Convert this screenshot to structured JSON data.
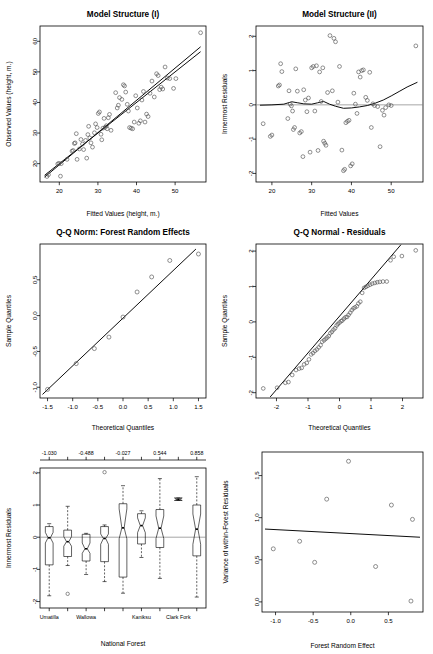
{
  "figure": {
    "kind": "model-diagnostics-panel",
    "rows": 3,
    "cols": 2,
    "point_color": "#4d4d4d",
    "line_color": "#000000",
    "ref_color": "#808080"
  },
  "chart_data": [
    {
      "id": "model-structure-1",
      "type": "scatter",
      "title": "Model Structure (I)",
      "xlabel": "Fitted Values (height, m.)",
      "ylabel": "Observed Values (height, m.)",
      "xlim": [
        15,
        58
      ],
      "ylim": [
        14,
        65
      ],
      "xticks": [
        20,
        30,
        40,
        50
      ],
      "yticks": [
        20,
        30,
        40,
        50,
        60
      ],
      "grid": false,
      "legend": null,
      "annotations": [
        "1:1 reference line",
        "least-squares fit line"
      ],
      "lines": [
        {
          "name": "y = x",
          "x": [
            16.2,
            56.6
          ],
          "y": [
            16.2,
            56.6
          ]
        },
        {
          "name": "fit",
          "x": [
            16.2,
            56.6
          ],
          "y": [
            15.6,
            58.2
          ]
        }
      ],
      "x": [
        16.8,
        17.2,
        19.6,
        19.9,
        20.3,
        20.5,
        22.0,
        23.3,
        23.6,
        23.9,
        24.1,
        24.4,
        24.6,
        25.2,
        25.6,
        26.0,
        26.3,
        26.8,
        27.1,
        27.4,
        27.6,
        27.9,
        28.2,
        28.6,
        29.1,
        29.4,
        29.8,
        30.1,
        30.4,
        30.8,
        31.0,
        31.3,
        31.6,
        31.9,
        32.2,
        32.4,
        32.7,
        33.0,
        33.4,
        34.6,
        35.0,
        35.3,
        35.6,
        36.2,
        36.6,
        36.9,
        37.2,
        37.6,
        37.9,
        38.2,
        38.6,
        39.0,
        39.4,
        39.8,
        40.2,
        40.6,
        41.0,
        41.4,
        41.8,
        42.2,
        42.6,
        43.0,
        43.5,
        44.0,
        44.6,
        45.2,
        45.6,
        46.0,
        46.4,
        46.8,
        47.4,
        48.0,
        48.6,
        49.6,
        50.2,
        56.6
      ],
      "y": [
        15.8,
        16.4,
        19.9,
        20.1,
        15.9,
        20.0,
        21.4,
        24.1,
        24.3,
        26.6,
        26.8,
        29.8,
        21.4,
        24.8,
        27.9,
        26.4,
        24.6,
        27.6,
        21.8,
        29.5,
        32.2,
        28.4,
        26.8,
        25.4,
        30.1,
        33.0,
        31.8,
        36.4,
        36.9,
        29.6,
        27.8,
        31.6,
        34.8,
        31.9,
        32.4,
        31.4,
        35.0,
        36.1,
        30.9,
        43.2,
        38.2,
        39.1,
        41.6,
        41.0,
        45.8,
        45.4,
        43.4,
        39.4,
        37.2,
        31.8,
        31.6,
        31.4,
        33.6,
        42.2,
        38.2,
        33.2,
        34.0,
        40.8,
        43.6,
        33.6,
        36.2,
        35.4,
        43.0,
        47.0,
        41.8,
        49.4,
        48.8,
        44.2,
        45.0,
        44.4,
        51.6,
        48.0,
        47.8,
        44.6,
        47.8,
        62.8
      ]
    },
    {
      "id": "model-structure-2",
      "type": "scatter",
      "title": "Model Structure (II)",
      "xlabel": "Fitted Values",
      "ylabel": "Innermost Residuals",
      "xlim": [
        16,
        58
      ],
      "ylim": [
        -2.25,
        2.3
      ],
      "xticks": [
        20,
        30,
        40,
        50
      ],
      "yticks": [
        -2,
        -1,
        0,
        1,
        2
      ],
      "grid": false,
      "legend": null,
      "annotations": [
        "horizontal zero reference line",
        "loess smoother"
      ],
      "lines": [
        {
          "name": "loess",
          "x": [
            17.0,
            20.0,
            23.0,
            25.0,
            26.5,
            28.0,
            30.0,
            31.5,
            33.0,
            34.5,
            36.0,
            38.0,
            40.0,
            42.0,
            44.0,
            46.0,
            48.0,
            50.0,
            52.0,
            54.0,
            56.6
          ],
          "y": [
            -0.01,
            0.0,
            0.02,
            0.09,
            0.06,
            0.03,
            0.02,
            0.06,
            0.1,
            0.02,
            -0.04,
            -0.1,
            -0.09,
            -0.06,
            -0.02,
            0.05,
            0.14,
            0.26,
            0.39,
            0.52,
            0.66
          ]
        }
      ],
      "x": [
        17.8,
        19.6,
        20.0,
        21.6,
        21.9,
        22.2,
        22.5,
        24.0,
        24.3,
        24.6,
        24.9,
        25.2,
        25.4,
        25.7,
        26.0,
        26.4,
        27.0,
        27.4,
        27.8,
        28.0,
        28.4,
        28.8,
        29.2,
        29.6,
        30.0,
        30.4,
        30.8,
        31.2,
        31.6,
        32.0,
        32.4,
        32.8,
        33.0,
        33.3,
        33.6,
        34.0,
        34.6,
        35.2,
        35.6,
        36.0,
        36.6,
        37.0,
        37.6,
        38.0,
        38.3,
        38.6,
        39.0,
        39.4,
        39.8,
        40.2,
        40.6,
        41.0,
        41.4,
        41.8,
        42.2,
        42.6,
        43.0,
        43.6,
        44.0,
        44.6,
        45.0,
        45.4,
        45.8,
        46.6,
        47.2,
        47.8,
        48.2,
        48.6,
        49.4,
        50.0,
        56.2
      ],
      "y": [
        -0.55,
        -0.92,
        -0.88,
        0.55,
        0.58,
        1.2,
        0.97,
        -0.4,
        0.41,
        0.02,
        -0.03,
        -0.18,
        -0.72,
        -0.66,
        1.05,
        0.4,
        -0.82,
        -0.78,
        -1.51,
        0.44,
        0.14,
        -0.2,
        0.2,
        -1.38,
        1.08,
        1.12,
        -0.18,
        1.14,
        -1.33,
        0.96,
        0.1,
        1.08,
        -1.06,
        -1.12,
        -1.18,
        0.36,
        2.02,
        0.41,
        1.94,
        1.84,
        0.08,
        1.12,
        -1.32,
        -1.92,
        -1.88,
        -0.52,
        -0.48,
        -0.45,
        -1.78,
        -1.72,
        0.34,
        0.02,
        -0.25,
        0.96,
        0.81,
        1.0,
        1.02,
        0.22,
        0.13,
        0.95,
        -0.66,
        0.03,
        -0.02,
        -0.05,
        -1.22,
        -0.16,
        -0.3,
        -0.08,
        0.0,
        -0.02,
        1.72
      ]
    },
    {
      "id": "qq-forest-random-effects",
      "type": "scatter",
      "title": "Q-Q Norm: Forest Random Effects",
      "xlabel": "Theoretical Quantiles",
      "ylabel": "Sample Quantiles",
      "xlim": [
        -1.65,
        1.65
      ],
      "ylim": [
        -1.15,
        1.0
      ],
      "xticks": [
        -1.5,
        -1.0,
        -0.5,
        0.0,
        0.5,
        1.0,
        1.5
      ],
      "xticklabels": [
        "-1.5",
        "-1.0",
        "-0.5",
        "0.0",
        "0.5",
        "1.0",
        "1.5"
      ],
      "yticks": [
        -1.0,
        -0.5,
        0.0,
        0.5
      ],
      "yticklabels": [
        "-1.0",
        "-0.5",
        "0.0",
        "0.5"
      ],
      "grid": false,
      "legend": null,
      "annotations": [
        "q-q reference line"
      ],
      "lines": [
        {
          "name": "qqline",
          "x": [
            -1.6,
            1.45
          ],
          "y": [
            -1.1,
            0.93
          ]
        }
      ],
      "x": [
        -1.5,
        -0.93,
        -0.57,
        -0.28,
        0.0,
        0.28,
        0.57,
        0.93,
        1.5
      ],
      "y": [
        -1.03,
        -0.67,
        -0.46,
        -0.3,
        -0.02,
        0.33,
        0.54,
        0.77,
        0.86
      ]
    },
    {
      "id": "qq-normal-residuals",
      "type": "scatter",
      "title": "Q-Q Normal - Residuals",
      "xlabel": "Theoretical Quantiles",
      "ylabel": "Sample Quantiles",
      "xlim": [
        -2.65,
        2.65
      ],
      "ylim": [
        -2.15,
        2.2
      ],
      "xticks": [
        -2,
        -1,
        0,
        1,
        2
      ],
      "yticks": [
        -2,
        -1,
        0,
        1,
        2
      ],
      "grid": false,
      "legend": null,
      "annotations": [
        "q-q reference line"
      ],
      "lines": [
        {
          "name": "qqline",
          "x": [
            -2.2,
            1.95
          ],
          "y": [
            -2.12,
            2.18
          ]
        }
      ],
      "x": [
        -2.42,
        -1.98,
        -1.72,
        -1.62,
        -1.5,
        -1.38,
        -1.28,
        -1.2,
        -1.12,
        -1.04,
        -0.97,
        -0.9,
        -0.84,
        -0.78,
        -0.72,
        -0.66,
        -0.6,
        -0.55,
        -0.49,
        -0.44,
        -0.39,
        -0.34,
        -0.29,
        -0.24,
        -0.19,
        -0.14,
        -0.09,
        -0.05,
        0.0,
        0.05,
        0.09,
        0.14,
        0.19,
        0.24,
        0.29,
        0.34,
        0.39,
        0.44,
        0.49,
        0.55,
        0.6,
        0.66,
        0.72,
        0.78,
        0.84,
        0.9,
        0.97,
        1.04,
        1.12,
        1.2,
        1.28,
        1.38,
        1.5,
        1.62,
        1.72,
        1.98,
        2.42
      ],
      "y": [
        -1.88,
        -1.86,
        -1.72,
        -1.7,
        -1.5,
        -1.36,
        -1.32,
        -1.3,
        -1.2,
        -1.16,
        -1.06,
        -0.92,
        -0.88,
        -0.82,
        -0.78,
        -0.72,
        -0.66,
        -0.56,
        -0.52,
        -0.48,
        -0.44,
        -0.4,
        -0.32,
        -0.28,
        -0.22,
        -0.18,
        -0.1,
        -0.06,
        -0.02,
        0.02,
        0.04,
        0.09,
        0.13,
        0.14,
        0.2,
        0.26,
        0.33,
        0.38,
        0.41,
        0.44,
        0.52,
        0.57,
        0.82,
        0.96,
        0.99,
        1.02,
        1.05,
        1.08,
        1.1,
        1.12,
        1.13,
        1.14,
        1.14,
        1.74,
        1.84,
        1.86,
        2.02
      ]
    },
    {
      "id": "residuals-by-forest",
      "type": "boxplot",
      "title": "",
      "xlabel": "National Forest",
      "ylabel": "Innermost Residuals",
      "ylim": [
        -2.2,
        2.15
      ],
      "yticks": [
        -2,
        -1,
        0,
        1,
        2
      ],
      "grid": false,
      "legend": null,
      "annotations": [
        "notched boxes",
        "zero reference line",
        "top axis labelled with forest random effects"
      ],
      "categories": [
        "Umatilla",
        "",
        "Wallowa",
        "",
        "",
        "Kaniksu",
        "",
        "Clark Fork",
        ""
      ],
      "xticklabels_shown": [
        "Umatilla",
        "Wallowa",
        "Kaniksu",
        "Clark Fork"
      ],
      "top_axis_labels": [
        "-1.030",
        "-0.488",
        "-0.027",
        "0.544",
        "0.858"
      ],
      "top_axis_positions": [
        1,
        3,
        5,
        7,
        9
      ],
      "boxes": [
        {
          "category": "Umatilla",
          "lower_whisker": -1.82,
          "q1": -0.86,
          "median": -0.02,
          "q3": 0.33,
          "upper_whisker": 0.42,
          "notch_lower": -0.18,
          "notch_upper": 0.15,
          "outliers": []
        },
        {
          "category": "",
          "lower_whisker": -0.88,
          "q1": -0.6,
          "median": -0.14,
          "q3": 0.22,
          "upper_whisker": 0.96,
          "notch_lower": -0.28,
          "notch_upper": 0.02,
          "outliers": [
            -1.76
          ]
        },
        {
          "category": "Wallowa",
          "lower_whisker": -1.16,
          "q1": -0.74,
          "median": -0.36,
          "q3": 0.09,
          "upper_whisker": 0.12,
          "notch_lower": -0.5,
          "notch_upper": -0.18,
          "outliers": []
        },
        {
          "category": "",
          "lower_whisker": -1.38,
          "q1": -0.76,
          "median": -0.04,
          "q3": 0.33,
          "upper_whisker": 0.38,
          "notch_lower": -0.22,
          "notch_upper": 0.1,
          "outliers": [
            2.02
          ]
        },
        {
          "category": "",
          "lower_whisker": -1.74,
          "q1": -1.24,
          "median": 0.29,
          "q3": 1.04,
          "upper_whisker": 1.6,
          "notch_lower": -0.05,
          "notch_upper": 0.88,
          "outliers": []
        },
        {
          "category": "Kaniksu",
          "lower_whisker": -0.63,
          "q1": -0.21,
          "median": 0.36,
          "q3": 0.73,
          "upper_whisker": 0.82,
          "notch_lower": 0.14,
          "notch_upper": 0.6,
          "outliers": []
        },
        {
          "category": "",
          "lower_whisker": -1.28,
          "q1": -0.32,
          "median": 0.28,
          "q3": 0.86,
          "upper_whisker": 1.82,
          "notch_lower": -0.04,
          "notch_upper": 0.66,
          "outliers": []
        },
        {
          "category": "Clark Fork",
          "lower_whisker": 1.14,
          "q1": 1.14,
          "median": 1.18,
          "q3": 1.22,
          "upper_whisker": 1.22,
          "notch_lower": 1.14,
          "notch_upper": 1.22,
          "outliers": []
        },
        {
          "category": "",
          "lower_whisker": -1.86,
          "q1": -0.58,
          "median": 0.25,
          "q3": 1.0,
          "upper_whisker": 1.88,
          "notch_lower": -0.22,
          "notch_upper": 0.72,
          "outliers": []
        }
      ]
    },
    {
      "id": "variance-vs-random-effect",
      "type": "scatter",
      "title": "",
      "xlabel": "Forest Random Effect",
      "ylabel": "Variance of within-Forest Residuals",
      "xlim": [
        -1.18,
        0.96
      ],
      "ylim": [
        -0.12,
        1.78
      ],
      "xticks": [
        -1.0,
        -0.5,
        0.0,
        0.5
      ],
      "xticklabels": [
        "-1.0",
        "-0.5",
        "0.0",
        "0.5"
      ],
      "yticks": [
        0.0,
        0.5,
        1.0,
        1.5
      ],
      "yticklabels": [
        "0.0",
        "0.5",
        "1.0",
        "1.5"
      ],
      "grid": false,
      "legend": null,
      "annotations": [
        "linear trend line"
      ],
      "lines": [
        {
          "name": "trend",
          "x": [
            -1.14,
            0.92
          ],
          "y": [
            0.865,
            0.768
          ]
        }
      ],
      "x": [
        -1.03,
        -0.68,
        -0.48,
        -0.32,
        -0.03,
        0.33,
        0.54,
        0.8,
        0.82
      ],
      "y": [
        0.63,
        0.72,
        0.47,
        1.22,
        1.67,
        0.42,
        1.15,
        0.01,
        0.98
      ]
    }
  ]
}
